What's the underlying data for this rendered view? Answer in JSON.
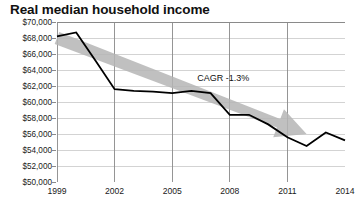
{
  "chart_data": {
    "type": "line",
    "title": "Real median household income",
    "xlabel": "",
    "ylabel": "",
    "ylim": [
      50000,
      70000
    ],
    "xlim": [
      1999,
      2014
    ],
    "grid": true,
    "legend": "none",
    "y_ticks": [
      70000,
      68000,
      66000,
      64000,
      62000,
      60000,
      58000,
      56000,
      54000,
      52000,
      50000
    ],
    "y_tick_labels": [
      "$70,000",
      "$68,000",
      "$66,000",
      "$64,000",
      "$62,000",
      "$60,000",
      "$58,000",
      "$56,000",
      "$54,000",
      "$52,000",
      "$50,000"
    ],
    "x_ticks": [
      1999,
      2002,
      2005,
      2008,
      2011,
      2014
    ],
    "x_tick_labels": [
      "1999",
      "2002",
      "2005",
      "2008",
      "2011",
      "2014"
    ],
    "x": [
      1999,
      2000,
      2001,
      2002,
      2003,
      2004,
      2005,
      2006,
      2007,
      2008,
      2009,
      2010,
      2011,
      2012,
      2013,
      2014
    ],
    "values": [
      68200,
      68700,
      65200,
      61600,
      61400,
      61300,
      61100,
      61400,
      61100,
      58400,
      58400,
      57200,
      55600,
      54500,
      56200,
      55200
    ],
    "series": [
      {
        "name": "Real median household income",
        "values": [
          68200,
          68700,
          65200,
          61600,
          61400,
          61300,
          61100,
          61400,
          61100,
          58400,
          58400,
          57200,
          55600,
          54500,
          56200,
          55200
        ],
        "color": "#000000",
        "line_width": 1.8
      }
    ],
    "annotations": [
      {
        "name": "cagr-label",
        "text": "CAGR -1.3%",
        "x": 2006.3,
        "y": 62900
      }
    ],
    "trend_arrow": {
      "name": "cagr-trend-arrow",
      "label": "CAGR -1.3%",
      "color": "#b5b5b5",
      "start_x": 1999,
      "start_y": 68000,
      "end_x": 2012,
      "end_y": 56000
    },
    "colors": {
      "line": "#000000",
      "arrow": "#b5b5b5",
      "grid": "#c8c8c8",
      "axis": "#8a8a8a",
      "text": "#1a1a1a",
      "background": "#ffffff"
    }
  }
}
